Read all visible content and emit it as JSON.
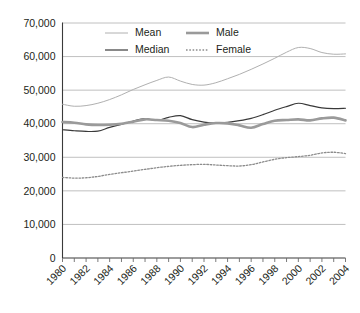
{
  "chart_data": {
    "type": "line",
    "title": "",
    "xlabel": "",
    "ylabel": "",
    "xlim": [
      1980,
      2004
    ],
    "ylim": [
      0,
      70000
    ],
    "grid": true,
    "legend_position": "top-center",
    "ytick_labels": [
      "70,000",
      "60,000",
      "50,000",
      "40,000",
      "30,000",
      "20,000",
      "10,000",
      "0"
    ],
    "ytick_values": [
      70000,
      60000,
      50000,
      40000,
      30000,
      20000,
      10000,
      0
    ],
    "xtick_labels": [
      "1980",
      "1982",
      "1984",
      "1986",
      "1988",
      "1990",
      "1992",
      "1994",
      "1996",
      "1998",
      "2000",
      "2002",
      "2004"
    ],
    "xtick_values": [
      1980,
      1982,
      1984,
      1986,
      1988,
      1990,
      1992,
      1994,
      1996,
      1998,
      2000,
      2002,
      2004
    ],
    "x": [
      1980,
      1981,
      1982,
      1983,
      1984,
      1985,
      1986,
      1987,
      1988,
      1989,
      1990,
      1991,
      1992,
      1993,
      1994,
      1995,
      1996,
      1997,
      1998,
      1999,
      2000,
      2001,
      2002,
      2003,
      2004
    ],
    "series": [
      {
        "name": "Mean",
        "color": "#b0b0b0",
        "width": 1.0,
        "dash": "none",
        "values": [
          45800,
          45200,
          45400,
          46100,
          47200,
          48600,
          50200,
          51600,
          52900,
          53900,
          52700,
          51700,
          51500,
          52200,
          53400,
          54700,
          56200,
          57800,
          59500,
          61300,
          62700,
          62400,
          61200,
          60700,
          60800
        ]
      },
      {
        "name": "Median",
        "color": "#3a3a3a",
        "width": 1.2,
        "dash": "none",
        "values": [
          38200,
          37900,
          37700,
          37800,
          38900,
          39800,
          40800,
          41500,
          41000,
          41900,
          42400,
          41200,
          40500,
          40200,
          40400,
          40900,
          41600,
          42700,
          44000,
          45100,
          46100,
          45400,
          44700,
          44500,
          44600
        ]
      },
      {
        "name": "Male",
        "color": "#9a9a9a",
        "width": 2.6,
        "dash": "none",
        "values": [
          40500,
          40300,
          39800,
          39600,
          39700,
          40000,
          40600,
          41300,
          41100,
          40900,
          40200,
          39000,
          39700,
          40200,
          40100,
          39500,
          38800,
          39900,
          40900,
          41100,
          41300,
          41000,
          41600,
          41800,
          41000
        ]
      },
      {
        "name": "Female",
        "color": "#8c8c8c",
        "width": 1.3,
        "dash": "1.6 1.7",
        "values": [
          24000,
          23800,
          23900,
          24300,
          24900,
          25400,
          25900,
          26400,
          26900,
          27300,
          27600,
          27800,
          27900,
          27700,
          27500,
          27400,
          27800,
          28600,
          29400,
          29900,
          30200,
          30600,
          31300,
          31500,
          31100
        ]
      }
    ],
    "legend": [
      {
        "label": "Mean",
        "color": "#b0b0b0",
        "width": 1.0,
        "dash": "none"
      },
      {
        "label": "Male",
        "color": "#9a9a9a",
        "width": 2.6,
        "dash": "none"
      },
      {
        "label": "Median",
        "color": "#3a3a3a",
        "width": 1.2,
        "dash": "none"
      },
      {
        "label": "Female",
        "color": "#8c8c8c",
        "width": 1.3,
        "dash": "1.6 1.7"
      }
    ]
  }
}
